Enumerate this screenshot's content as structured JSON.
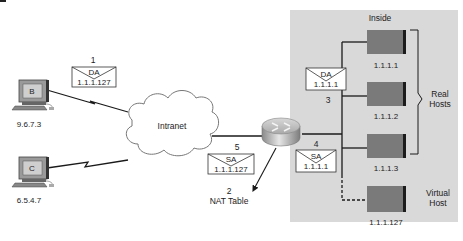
{
  "figure_marker": "",
  "inside_zone": {
    "label": "Inside",
    "fill": "#d9d9d9"
  },
  "cloud": {
    "label": "Intranet"
  },
  "hosts_outside": [
    {
      "id": "B",
      "ip": "9.6.7.3"
    },
    {
      "id": "C",
      "ip": "6.5.4.7"
    }
  ],
  "servers": [
    {
      "ip": "1.1.1.1",
      "kind": "real"
    },
    {
      "ip": "1.1.1.2",
      "kind": "real"
    },
    {
      "ip": "1.1.1.3",
      "kind": "real"
    },
    {
      "ip": "1.1.1.127",
      "kind": "virtual"
    }
  ],
  "group_labels": {
    "real_line1": "Real",
    "real_line2": "Hosts",
    "virtual_line1": "Virtual",
    "virtual_line2": "Host"
  },
  "packets": [
    {
      "step": "1",
      "field": "DA",
      "addr": "1.1.1.127"
    },
    {
      "step": "3",
      "field": "DA",
      "addr": "1.1.1.1"
    },
    {
      "step": "4",
      "field": "SA",
      "addr": "1.1.1.1"
    },
    {
      "step": "5",
      "field": "SA",
      "addr": "1.1.1.127"
    }
  ],
  "nat_table": {
    "step": "2",
    "label": "NAT Table"
  },
  "colors": {
    "server": "#7a7a7a",
    "server_edge": "#1c1c1c",
    "line": "#1a1a1a"
  }
}
